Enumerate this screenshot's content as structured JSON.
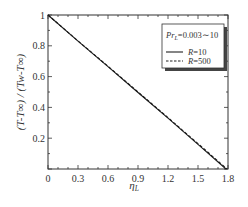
{
  "chart_data": {
    "type": "line",
    "title": "",
    "xlabel": "η_L",
    "ylabel": "(T−T∞) / (T_w−T∞)",
    "xlim": [
      0,
      1.8
    ],
    "ylim": [
      0,
      1
    ],
    "xticks": [
      "0",
      "0.3",
      "0.6",
      "0.9",
      "1.2",
      "1.5",
      "1.8"
    ],
    "yticks": [
      "0.2",
      "0.4",
      "0.6",
      "0.8",
      "1"
    ],
    "grid": false,
    "legend_position": "upper right",
    "annotation": "Pr_L=0.003~10",
    "series": [
      {
        "name": "R=10",
        "style": "solid",
        "x": [
          0,
          0.3,
          0.6,
          0.9,
          1.2,
          1.5,
          1.78
        ],
        "y": [
          1.0,
          0.83,
          0.665,
          0.497,
          0.33,
          0.16,
          0.0
        ]
      },
      {
        "name": "R=500",
        "style": "dashed",
        "x": [
          0,
          0.3,
          0.6,
          0.9,
          1.2,
          1.5,
          1.79
        ],
        "y": [
          1.0,
          0.832,
          0.667,
          0.5,
          0.333,
          0.165,
          0.0
        ]
      }
    ]
  },
  "plot": {
    "x_axis_label_main": "η",
    "x_axis_label_sub": "L",
    "y_axis_label": "(T-T∞) / (Tw-T∞)",
    "legend": {
      "title_main": "Pr",
      "title_sub": "L",
      "title_rest": "=0.003∼10",
      "entries": [
        {
          "label_var": "R",
          "label_val": "=10"
        },
        {
          "label_var": "R",
          "label_val": "=500"
        }
      ]
    }
  }
}
